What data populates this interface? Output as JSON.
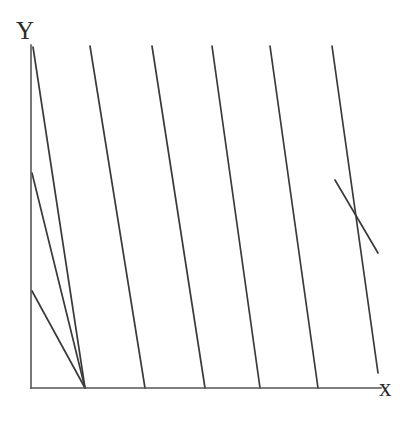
{
  "figure": {
    "background_color": "#ffffff",
    "width": 420,
    "height": 422
  },
  "axes": {
    "x_label": "x",
    "y_label": "Y",
    "color": "#555555",
    "stroke_width": 1.6,
    "origin": {
      "x": 31,
      "y": 388
    },
    "x_axis": {
      "x1": 31,
      "y1": 388,
      "x2": 381,
      "y2": 388
    },
    "y_axis": {
      "x1": 31,
      "y1": 388,
      "x2": 31,
      "y2": 45
    }
  },
  "chart_data": {
    "type": "line",
    "xlabel": "x",
    "ylabel": "Y",
    "grid": false,
    "legend": null,
    "plot_box": {
      "left": 31,
      "top": 45,
      "right": 378,
      "bottom": 388
    },
    "line_color": "#3a3a3a",
    "line_width": 1.7,
    "slope_dy_dx": 1.83,
    "series": [
      {
        "name": "line-1",
        "x": [
          33,
          85
        ],
        "y": [
          47,
          388
        ]
      },
      {
        "name": "line-2",
        "x": [
          32,
          85
        ],
        "y": [
          173,
          388
        ]
      },
      {
        "name": "line-3",
        "x": [
          32,
          85
        ],
        "y": [
          291,
          388
        ]
      },
      {
        "name": "line-4",
        "x": [
          90,
          145
        ],
        "y": [
          46,
          388
        ]
      },
      {
        "name": "line-5",
        "x": [
          152,
          205
        ],
        "y": [
          46,
          388
        ]
      },
      {
        "name": "line-6",
        "x": [
          212,
          260
        ],
        "y": [
          46,
          388
        ]
      },
      {
        "name": "line-7",
        "x": [
          270,
          318
        ],
        "y": [
          46,
          388
        ]
      },
      {
        "name": "line-8",
        "x": [
          332,
          378
        ],
        "y": [
          46,
          373
        ]
      },
      {
        "name": "line-9",
        "x": [
          335,
          378
        ],
        "y": [
          180,
          253
        ]
      }
    ]
  },
  "lines": [
    {
      "name": "diagonal-line-1",
      "x1": 33,
      "y1": 47,
      "x2": 85,
      "y2": 388
    },
    {
      "name": "diagonal-line-2",
      "x1": 32,
      "y1": 173,
      "x2": 85,
      "y2": 388
    },
    {
      "name": "diagonal-line-3",
      "x1": 32,
      "y1": 291,
      "x2": 85,
      "y2": 388
    },
    {
      "name": "diagonal-line-4",
      "x1": 90,
      "y1": 46,
      "x2": 145,
      "y2": 388
    },
    {
      "name": "diagonal-line-5",
      "x1": 152,
      "y1": 46,
      "x2": 205,
      "y2": 388
    },
    {
      "name": "diagonal-line-6",
      "x1": 212,
      "y1": 46,
      "x2": 260,
      "y2": 388
    },
    {
      "name": "diagonal-line-7",
      "x1": 270,
      "y1": 46,
      "x2": 318,
      "y2": 388
    },
    {
      "name": "diagonal-line-8",
      "x1": 332,
      "y1": 46,
      "x2": 378,
      "y2": 373
    },
    {
      "name": "diagonal-line-9",
      "x1": 335,
      "y1": 180,
      "x2": 378,
      "y2": 253
    }
  ]
}
